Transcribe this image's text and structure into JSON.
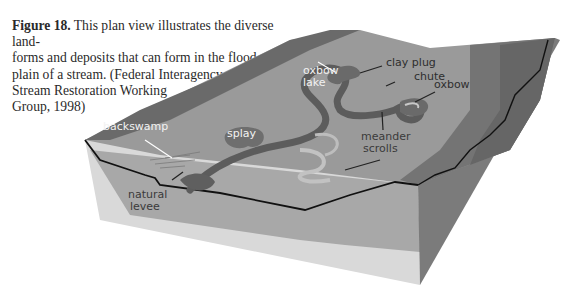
{
  "caption": {
    "figure_label": "Figure 18.",
    "lines": [
      " This plan view illustrates the diverse land-",
      "forms and deposits that can form in the flood-",
      "plain of a stream. (Federal Interagency",
      "Stream Restoration Working",
      "Group, 1998)"
    ]
  },
  "labels": {
    "oxbow_lake_1": "oxbow",
    "oxbow_lake_2": "lake",
    "clay_plug": "clay plug",
    "chute": "chute",
    "oxbow": "oxbow",
    "backswamp": "backswamp",
    "splay": "splay",
    "meander_scrolls_1": "meander",
    "meander_scrolls_2": "scrolls",
    "natural_levee_1": "natural",
    "natural_levee_2": "levee"
  },
  "colors": {
    "upland_dark": "#6e6e6e",
    "upland_mid": "#858585",
    "floodplain": "#9c9c9c",
    "channel": "#5f5f5f",
    "scroll_light": "#bdbdbd",
    "block_front": "#d6d6d6",
    "block_side": "#7a7a7a",
    "label_dark": "#3a3a3a",
    "label_light": "#f2f2f2"
  }
}
